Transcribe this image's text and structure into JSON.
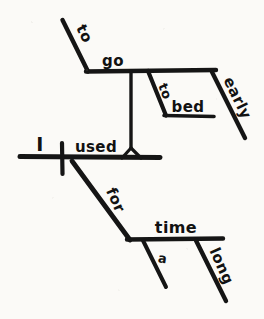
{
  "diagram": {
    "type": "reed-kellogg-sentence-diagram",
    "sentence": "I used to go to bed early for a long time",
    "ink_color": "#151515",
    "paper_color": "#fbfaf7",
    "words": {
      "subject": "I",
      "verb": "used",
      "infinitive_marker_top": "to",
      "infinitive_verb": "go",
      "prep_to": "to",
      "prep_object_bed": "bed",
      "adverb_early": "early",
      "prep_for": "for",
      "prep_object_time": "time",
      "article_a": "a",
      "adjective_long": "long"
    }
  }
}
